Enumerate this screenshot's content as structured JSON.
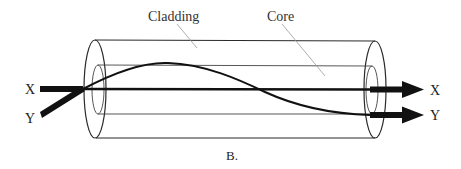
{
  "figure": {
    "caption": "B.",
    "labels": {
      "cladding": "Cladding",
      "core": "Core",
      "input_x": "X",
      "input_y": "Y",
      "output_x": "X",
      "output_y": "Y"
    },
    "colors": {
      "stroke": "#222222",
      "leader_line": "#888888",
      "background": "#ffffff"
    }
  }
}
